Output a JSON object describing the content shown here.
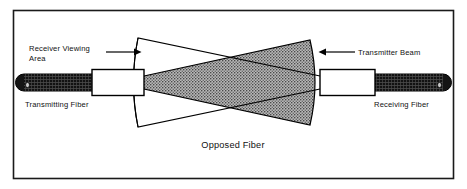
{
  "figure": {
    "caption": "Opposed Fiber",
    "border_color": "#1a1a1a",
    "background_color": "#ffffff"
  },
  "labels": {
    "receiver_viewing_line1": "Receiver Viewing",
    "receiver_viewing_line2": "Area",
    "transmitting_fiber": "Transmitting Fiber",
    "transmitter_beam": "Transmitter Beam",
    "receiving_fiber": "Receiving Fiber"
  },
  "components": {
    "left_cable_color": "#141414",
    "right_cable_color": "#141414",
    "ferrule_color": "#ffffff",
    "beam_fill_color": "#9a9a9a",
    "outline_color": "#000000"
  }
}
